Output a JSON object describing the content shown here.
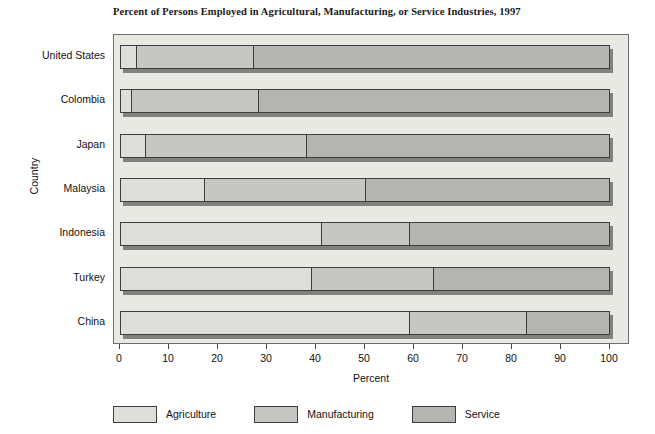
{
  "chart_data": {
    "type": "bar",
    "subtype": "horizontal-stacked-100",
    "title": "Percent of Persons Employed in Agricultural, Manufacturing, or Service Industries, 1997",
    "xlabel": "Percent",
    "ylabel": "Country",
    "xlim": [
      0,
      100
    ],
    "xticks": [
      "0",
      "10",
      "20",
      "30",
      "40",
      "50",
      "60",
      "70",
      "80",
      "90",
      "100"
    ],
    "grid": false,
    "legend_position": "bottom",
    "categories": [
      "United States",
      "Colombia",
      "Japan",
      "Malaysia",
      "Indonesia",
      "Turkey",
      "China"
    ],
    "series": [
      {
        "name": "Agriculture",
        "color": "#dededa",
        "values": [
          3,
          2,
          5,
          17,
          41,
          39,
          59
        ]
      },
      {
        "name": "Manufacturing",
        "color": "#c6c6c2",
        "values": [
          24,
          26,
          33,
          33,
          18,
          25,
          24
        ]
      },
      {
        "name": "Service",
        "color": "#b4b4b0",
        "values": [
          73,
          72,
          62,
          50,
          41,
          36,
          17
        ]
      }
    ]
  },
  "legend": {
    "items": [
      {
        "label": "Agriculture"
      },
      {
        "label": "Manufacturing"
      },
      {
        "label": "Service"
      }
    ]
  }
}
